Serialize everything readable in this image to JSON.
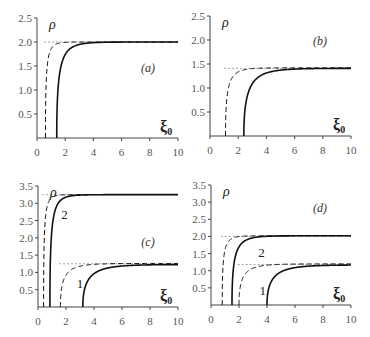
{
  "chart_data": [
    {
      "type": "line",
      "panel": "(a)",
      "title": "",
      "xlabel": "ξ0",
      "ylabel": "ρ",
      "xlim": [
        0,
        10
      ],
      "ylim": [
        0,
        2.5
      ],
      "xticks": [
        "0",
        "2",
        "4",
        "6",
        "8",
        "10"
      ],
      "yticks": [
        "0.5",
        "1.0",
        "1.5",
        "2.0",
        "2.5"
      ],
      "asymptotes": [
        2.0
      ],
      "series": [
        {
          "name": "dashed",
          "style": "dashed",
          "x0": 0.6,
          "limit": 2.0,
          "k": 0.9
        },
        {
          "name": "solid",
          "style": "solid",
          "x0": 1.4,
          "limit": 2.0,
          "k": 0.55
        }
      ],
      "annotations": []
    },
    {
      "type": "line",
      "panel": "(b)",
      "title": "",
      "xlabel": "ξ0",
      "ylabel": "ρ",
      "xlim": [
        0,
        10
      ],
      "ylim": [
        0,
        2.5
      ],
      "xticks": [
        "0",
        "2",
        "4",
        "6",
        "8",
        "10"
      ],
      "yticks": [
        "0.5",
        "1.0",
        "1.5",
        "2.0",
        "2.5"
      ],
      "asymptotes": [
        1.41
      ],
      "series": [
        {
          "name": "dashed",
          "style": "dashed",
          "x0": 1.1,
          "limit": 1.42,
          "k": 0.6
        },
        {
          "name": "solid",
          "style": "solid",
          "x0": 2.4,
          "limit": 1.41,
          "k": 0.4
        }
      ],
      "annotations": []
    },
    {
      "type": "line",
      "panel": "(c)",
      "title": "",
      "xlabel": "ξ0",
      "ylabel": "ρ",
      "xlim": [
        0,
        10
      ],
      "ylim": [
        0,
        3.5
      ],
      "xticks": [
        "0",
        "2",
        "4",
        "6",
        "8",
        "10"
      ],
      "yticks": [
        "0.5",
        "1.0",
        "1.5",
        "2.0",
        "2.5",
        "3.0",
        "3.5"
      ],
      "asymptotes": [
        3.25,
        1.25
      ],
      "series": [
        {
          "name": "curve 2 dashed",
          "style": "dashed",
          "x0": 0.4,
          "limit": 3.25,
          "k": 1.0
        },
        {
          "name": "curve 2 solid",
          "style": "solid",
          "x0": 0.85,
          "limit": 3.25,
          "k": 0.7
        },
        {
          "name": "curve 1 dashed",
          "style": "dashed",
          "x0": 1.6,
          "limit": 1.26,
          "k": 0.45
        },
        {
          "name": "curve 1 solid",
          "style": "solid",
          "x0": 3.2,
          "limit": 1.23,
          "k": 0.35
        }
      ],
      "annotations": [
        {
          "text": "2",
          "x": 1.9,
          "y": 2.55
        },
        {
          "text": "1",
          "x": 3.0,
          "y": 0.55
        }
      ]
    },
    {
      "type": "line",
      "panel": "(d)",
      "title": "",
      "xlabel": "ξ0",
      "ylabel": "ρ",
      "xlim": [
        0,
        10
      ],
      "ylim": [
        0,
        3.5
      ],
      "xticks": [
        "0",
        "2",
        "4",
        "6",
        "8",
        "10"
      ],
      "yticks": [
        "0.5",
        "1.0",
        "1.5",
        "2.0",
        "2.5",
        "3.0",
        "3.5"
      ],
      "asymptotes": [
        2.0,
        1.18
      ],
      "series": [
        {
          "name": "curve 2 dashed",
          "style": "dashed",
          "x0": 0.8,
          "limit": 2.02,
          "k": 0.8
        },
        {
          "name": "curve 2 solid",
          "style": "solid",
          "x0": 1.5,
          "limit": 2.02,
          "k": 0.55
        },
        {
          "name": "curve 1 dashed",
          "style": "dashed",
          "x0": 2.0,
          "limit": 1.2,
          "k": 0.45
        },
        {
          "name": "curve 1 solid",
          "style": "solid",
          "x0": 4.0,
          "limit": 1.17,
          "k": 0.35
        }
      ],
      "annotations": [
        {
          "text": "2",
          "x": 3.6,
          "y": 1.4
        },
        {
          "text": "1",
          "x": 3.7,
          "y": 0.3
        }
      ]
    }
  ],
  "labels": {
    "rho": "ρ",
    "xi": "ξ",
    "xi_sub": "0",
    "panels": [
      "(a)",
      "(b)",
      "(c)",
      "(d)"
    ]
  },
  "colors": {
    "axis": "#444444",
    "curve": "#111111",
    "asymptote": "#9a9a9a"
  }
}
